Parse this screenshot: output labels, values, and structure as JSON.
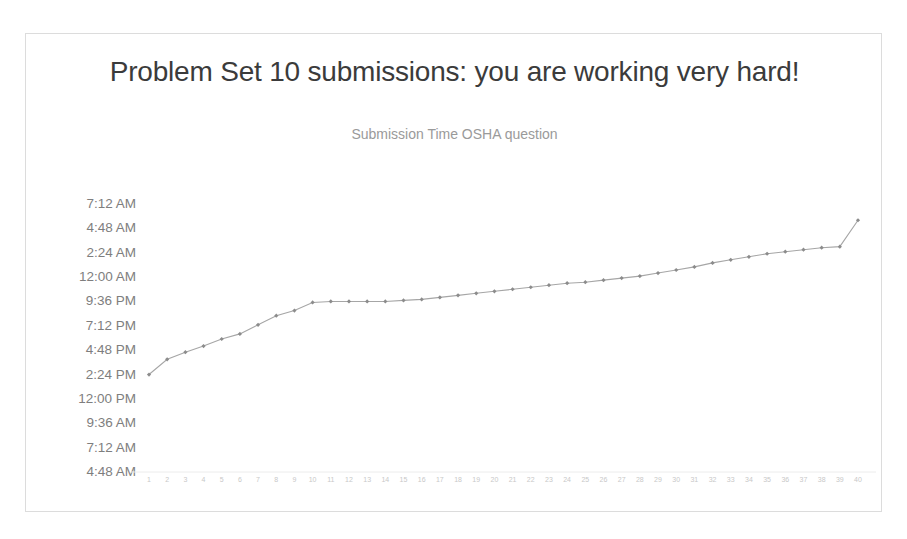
{
  "slide": {
    "title": "Problem Set 10 submissions: you are working very hard!"
  },
  "chart_data": {
    "type": "line",
    "title": "Submission Time OSHA question",
    "xlabel": "",
    "ylabel": "",
    "grid": false,
    "legend": false,
    "marker": "diamond",
    "line_color": "#a6a6a6",
    "marker_color": "#8c8c8c",
    "ytick_labels": [
      "7:12 AM",
      "4:48 AM",
      "2:24 AM",
      "12:00 AM",
      "9:36 PM",
      "7:12 PM",
      "4:48 PM",
      "2:24 PM",
      "12:00 PM",
      "9:36 AM",
      "7:12 AM",
      "4:48 AM"
    ],
    "ytick_hours": [
      31.2,
      28.8,
      26.4,
      24.0,
      21.6,
      19.2,
      16.8,
      14.4,
      12.0,
      9.6,
      7.2,
      4.8
    ],
    "ylim_hours": [
      4.8,
      31.2
    ],
    "categories": [
      "1",
      "2",
      "3",
      "4",
      "5",
      "6",
      "7",
      "8",
      "9",
      "10",
      "11",
      "12",
      "13",
      "14",
      "15",
      "16",
      "17",
      "18",
      "19",
      "20",
      "21",
      "22",
      "23",
      "24",
      "25",
      "26",
      "27",
      "28",
      "29",
      "30",
      "31",
      "32",
      "33",
      "34",
      "35",
      "36",
      "37",
      "38",
      "39",
      "40"
    ],
    "series": [
      {
        "name": "Submission Time",
        "values_hours": [
          14.4,
          15.9,
          16.6,
          17.2,
          17.9,
          18.4,
          19.3,
          20.2,
          20.7,
          21.5,
          21.6,
          21.6,
          21.6,
          21.6,
          21.7,
          21.8,
          22.0,
          22.2,
          22.4,
          22.6,
          22.8,
          23.0,
          23.2,
          23.4,
          23.5,
          23.7,
          23.9,
          24.1,
          24.4,
          24.7,
          25.0,
          25.4,
          25.7,
          26.0,
          26.3,
          26.5,
          26.7,
          26.9,
          27.0,
          29.6
        ],
        "values_labels": [
          "2:24 PM",
          "3:54 PM",
          "4:36 PM",
          "5:12 PM",
          "5:54 PM",
          "6:24 PM",
          "7:18 PM",
          "8:12 PM",
          "8:42 PM",
          "9:30 PM",
          "9:36 PM",
          "9:36 PM",
          "9:36 PM",
          "9:36 PM",
          "9:42 PM",
          "9:48 PM",
          "10:00 PM",
          "10:12 PM",
          "10:24 PM",
          "10:36 PM",
          "10:48 PM",
          "11:00 PM",
          "11:12 PM",
          "11:24 PM",
          "11:30 PM",
          "11:42 PM",
          "11:54 PM",
          "12:06 AM",
          "12:24 AM",
          "12:42 AM",
          "1:00 AM",
          "1:24 AM",
          "1:42 AM",
          "2:00 AM",
          "2:18 AM",
          "2:30 AM",
          "2:42 AM",
          "2:54 AM",
          "3:00 AM",
          "5:36 AM"
        ]
      }
    ]
  }
}
